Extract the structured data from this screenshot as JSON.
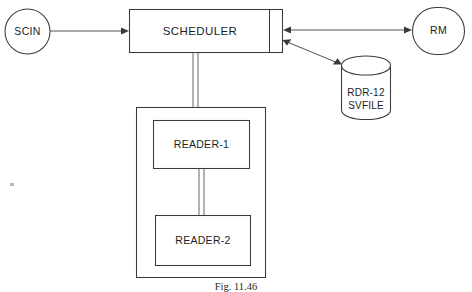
{
  "figure": {
    "caption": "Fig. 11.46",
    "line_color": "#3a3a3a",
    "background": "#ffffff"
  },
  "nodes": {
    "scin": {
      "label": "SCIN",
      "shape": "circle"
    },
    "scheduler": {
      "label": "SCHEDULER",
      "shape": "rectangle-with-right-compartment"
    },
    "rm": {
      "label": "RM",
      "shape": "rounded-oval"
    },
    "datastore": {
      "label_line1": "RDR-12",
      "label_line2": "SVFILE",
      "shape": "cylinder"
    },
    "reader_group": {
      "shape": "container-rectangle"
    },
    "reader1": {
      "label": "READER-1",
      "shape": "rectangle"
    },
    "reader2": {
      "label": "READER-2",
      "shape": "rectangle"
    }
  },
  "connections": [
    {
      "id": "scin-to-scheduler",
      "from": "scin",
      "to": "scheduler",
      "direction": "one-way"
    },
    {
      "id": "scheduler-to-rm",
      "from": "scheduler",
      "to": "rm",
      "direction": "bidirectional"
    },
    {
      "id": "scheduler-to-datastore",
      "from": "scheduler",
      "to": "datastore",
      "direction": "bidirectional"
    },
    {
      "id": "scheduler-to-reader-group",
      "from": "scheduler",
      "to": "reader_group",
      "direction": "bus-double-line"
    },
    {
      "id": "reader1-to-reader2",
      "from": "reader1",
      "to": "reader2",
      "direction": "bus-double-line"
    }
  ]
}
